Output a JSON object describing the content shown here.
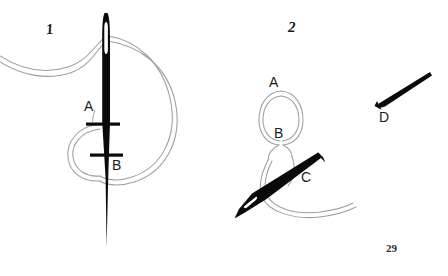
{
  "document": {
    "page_number": "29",
    "background_color": "#ffffff",
    "ink_color": "#000000",
    "thread_color": "#9a9a9a"
  },
  "figures": [
    {
      "number": "1",
      "caption_label": "1",
      "points": [
        {
          "label": "A",
          "description": "fabric entry point at needle shaft"
        },
        {
          "label": "B",
          "description": "fabric exit point lower on needle shaft"
        }
      ],
      "objects": [
        {
          "name": "needle",
          "orientation": "vertical",
          "color": "#000000"
        },
        {
          "name": "thread-loop",
          "color": "#9a9a9a"
        }
      ]
    },
    {
      "number": "2",
      "caption_label": "2",
      "points": [
        {
          "label": "A",
          "description": "top of thread loop"
        },
        {
          "label": "B",
          "description": "crossing inside thread loop"
        },
        {
          "label": "C",
          "description": "needle passing under loop"
        },
        {
          "label": "D",
          "description": "separate needle at upper right"
        }
      ],
      "objects": [
        {
          "name": "thread-loop",
          "color": "#9a9a9a"
        },
        {
          "name": "needle-c",
          "orientation": "diagonal",
          "color": "#000000"
        },
        {
          "name": "needle-d",
          "orientation": "diagonal",
          "color": "#000000"
        }
      ]
    }
  ],
  "labels": {
    "fig1": "1",
    "fig2": "2",
    "a1": "A",
    "b1": "B",
    "a2": "A",
    "b2": "B",
    "c2": "C",
    "d2": "D",
    "page_number": "29"
  }
}
